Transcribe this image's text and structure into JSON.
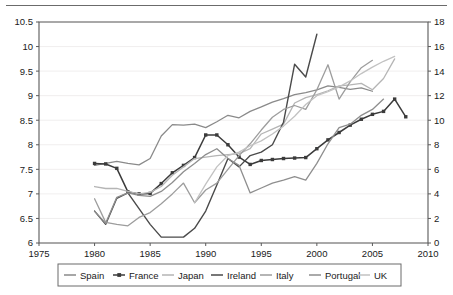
{
  "chart_data": {
    "type": "line",
    "title": "",
    "subtitle": "",
    "xlabel": "",
    "ylabel": "",
    "y2label": "",
    "xlim": [
      1975,
      2010
    ],
    "ylim": [
      6,
      10.5
    ],
    "y2lim": [
      0,
      18
    ],
    "grid": true,
    "legend_position": "bottom",
    "x_ticks": [
      "1975",
      "1980",
      "1985",
      "1990",
      "1995",
      "2000",
      "2005",
      "2010"
    ],
    "x_tick_values": [
      1975,
      1980,
      1985,
      1990,
      1995,
      2000,
      2005,
      2010
    ],
    "y_ticks": [
      "6",
      "6.5",
      "7",
      "7.5",
      "8",
      "8.5",
      "9",
      "9.5",
      "10",
      "10.5"
    ],
    "y_tick_values": [
      6,
      6.5,
      7,
      7.5,
      8,
      8.5,
      9,
      9.5,
      10,
      10.5
    ],
    "y2_ticks": [
      "0",
      "2",
      "4",
      "6",
      "8",
      "10",
      "12",
      "14",
      "16",
      "18"
    ],
    "y2_tick_values": [
      0,
      2,
      4,
      6,
      8,
      10,
      12,
      14,
      16,
      18
    ],
    "series": [
      {
        "name": "Spain",
        "color": "#8a8a8a",
        "axis": "left",
        "marker": false,
        "width": 1.3,
        "x": [
          1980,
          1981,
          1982,
          1983,
          1984,
          1985,
          1986,
          1987,
          1988,
          1989,
          1990,
          1991,
          1992,
          1993,
          1994,
          1995,
          1996,
          1997,
          1998,
          1999,
          2000,
          2001,
          2002,
          2003,
          2004,
          2005
        ],
        "values": [
          7.58,
          7.62,
          7.66,
          7.62,
          7.59,
          7.72,
          8.18,
          8.41,
          8.4,
          8.42,
          8.35,
          8.47,
          8.6,
          8.55,
          8.68,
          8.77,
          8.87,
          8.94,
          9.02,
          9.06,
          9.12,
          9.2,
          9.17,
          9.13,
          9.16,
          9.09
        ]
      },
      {
        "name": "France",
        "color": "#3b3b3b",
        "axis": "left",
        "marker": true,
        "width": 1.5,
        "x": [
          1980,
          1981,
          1982,
          1983,
          1984,
          1985,
          1986,
          1987,
          1988,
          1989,
          1990,
          1991,
          1992,
          1993,
          1994,
          1995,
          1996,
          1997,
          1998,
          1999,
          2000,
          2001,
          2002,
          2003,
          2004,
          2005,
          2006,
          2007,
          2008
        ],
        "values": [
          7.62,
          7.61,
          7.52,
          7.04,
          7.0,
          7.01,
          7.21,
          7.43,
          7.58,
          7.74,
          8.2,
          8.2,
          8.0,
          7.75,
          7.6,
          7.68,
          7.7,
          7.72,
          7.73,
          7.74,
          7.92,
          8.1,
          8.25,
          8.4,
          8.52,
          8.62,
          8.68,
          8.93,
          8.57
        ]
      },
      {
        "name": "Japan",
        "color": "#b5b5b5",
        "axis": "left",
        "marker": false,
        "width": 1.3,
        "x": [
          1980,
          1981,
          1982,
          1983,
          1984,
          1985,
          1986,
          1987,
          1988,
          1989,
          1990,
          1991,
          1992,
          1993,
          1994,
          1995,
          1996,
          1997,
          1998,
          1999,
          2000,
          2001,
          2002,
          2003,
          2004,
          2005,
          2006,
          2007
        ],
        "values": [
          7.15,
          7.11,
          7.11,
          7.05,
          7.0,
          7.03,
          7.15,
          7.38,
          7.55,
          7.72,
          7.75,
          7.78,
          7.8,
          7.82,
          7.92,
          8.22,
          8.32,
          8.42,
          8.85,
          8.96,
          9.02,
          9.1,
          9.2,
          9.22,
          9.25,
          9.12,
          9.35,
          9.75
        ]
      },
      {
        "name": "Ireland",
        "color": "#4a4a4a",
        "axis": "left",
        "marker": false,
        "width": 1.4,
        "x": [
          1980,
          1981,
          1982,
          1983,
          1984,
          1985,
          1986,
          1987,
          1988,
          1989,
          1990,
          1991,
          1992,
          1993,
          1994,
          1995,
          1996,
          1997,
          1998,
          1999,
          2000
        ],
        "values": [
          6.65,
          6.38,
          6.91,
          7.02,
          6.7,
          6.38,
          6.12,
          6.12,
          6.12,
          6.3,
          6.65,
          7.18,
          7.72,
          7.55,
          7.78,
          7.85,
          8.0,
          8.46,
          9.64,
          9.38,
          10.25
        ]
      },
      {
        "name": "Italy",
        "color": "#9d9d9d",
        "axis": "left",
        "marker": false,
        "width": 1.3,
        "x": [
          1980,
          1981,
          1982,
          1983,
          1984,
          1985,
          1986,
          1987,
          1988,
          1989,
          1990,
          1991,
          1992,
          1993,
          1994,
          1995,
          1996,
          1997,
          1998,
          1999,
          2000,
          2001,
          2002,
          2003,
          2004,
          2005
        ],
        "values": [
          6.9,
          6.42,
          6.38,
          6.35,
          6.52,
          6.62,
          6.8,
          7.0,
          7.22,
          6.82,
          7.08,
          7.22,
          7.5,
          7.78,
          8.02,
          8.3,
          8.56,
          8.72,
          8.8,
          8.72,
          9.12,
          9.63,
          8.93,
          9.28,
          9.57,
          9.72
        ]
      },
      {
        "name": "Portugal",
        "color": "#8e8e8e",
        "axis": "left",
        "marker": false,
        "width": 1.3,
        "x": [
          1980,
          1981,
          1982,
          1983,
          1984,
          1985,
          1986,
          1987,
          1988,
          1989,
          1990,
          1991,
          1992,
          1993,
          1994,
          1995,
          1996,
          1997,
          1998,
          1999,
          2000,
          2001,
          2002,
          2003,
          2004,
          2005,
          2006
        ],
        "values": [
          6.65,
          6.4,
          6.93,
          7.02,
          6.97,
          6.95,
          7.05,
          7.23,
          7.45,
          7.62,
          7.8,
          7.92,
          7.72,
          7.58,
          7.02,
          7.12,
          7.22,
          7.28,
          7.35,
          7.28,
          7.62,
          8.02,
          8.35,
          8.42,
          8.6,
          8.72,
          8.93
        ]
      },
      {
        "name": "UK",
        "color": "#c2c2c2",
        "axis": "left",
        "marker": false,
        "width": 1.3,
        "x": [
          1989,
          1990,
          1991,
          1992,
          1993,
          1994,
          1995,
          1996,
          1997,
          1998,
          1999,
          2000,
          2001,
          2002,
          2003,
          2004,
          2005,
          2006,
          2007
        ],
        "values": [
          6.82,
          7.2,
          7.55,
          7.78,
          7.85,
          7.98,
          8.08,
          8.22,
          8.38,
          8.58,
          8.82,
          9.0,
          9.08,
          9.18,
          9.3,
          9.45,
          9.58,
          9.7,
          9.8
        ]
      }
    ]
  },
  "legend": {
    "items": [
      {
        "label": "Spain",
        "color": "#8a8a8a",
        "marker": false
      },
      {
        "label": "France",
        "color": "#3b3b3b",
        "marker": true
      },
      {
        "label": "Japan",
        "color": "#b5b5b5",
        "marker": false
      },
      {
        "label": "Ireland",
        "color": "#4a4a4a",
        "marker": false
      },
      {
        "label": "Italy",
        "color": "#9d9d9d",
        "marker": false
      },
      {
        "label": "Portugal",
        "color": "#8e8e8e",
        "marker": false
      },
      {
        "label": "UK",
        "color": "#c2c2c2",
        "marker": false
      }
    ]
  }
}
